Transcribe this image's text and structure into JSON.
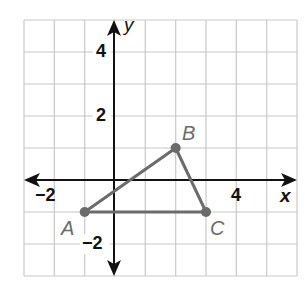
{
  "graph": {
    "x_axis_label": "x",
    "y_axis_label": "y",
    "x_range": [
      -3,
      6
    ],
    "y_range": [
      -3,
      5
    ],
    "x_tick_labels": [
      {
        "value": -2,
        "text": "−2"
      },
      {
        "value": 4,
        "text": "4"
      }
    ],
    "y_tick_labels": [
      {
        "value": 4,
        "text": "4"
      },
      {
        "value": 2,
        "text": "2"
      },
      {
        "value": -2,
        "text": "−2"
      }
    ],
    "colors": {
      "grid": "#c8c8c8",
      "axis": "#111111",
      "triangle": "#6b6b6b",
      "label": "#6b6b6b"
    }
  },
  "triangle": {
    "vertices": [
      {
        "name": "A",
        "x": -1,
        "y": -1
      },
      {
        "name": "B",
        "x": 2,
        "y": 1
      },
      {
        "name": "C",
        "x": 3,
        "y": -1
      }
    ]
  }
}
